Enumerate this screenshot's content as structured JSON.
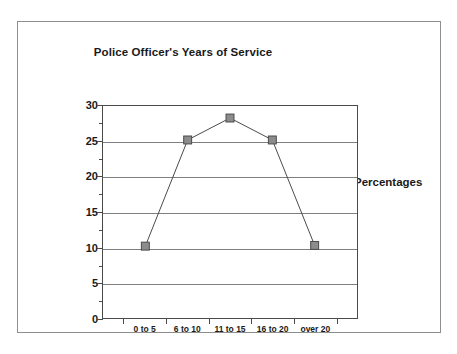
{
  "figure": {
    "title": "Police Officer's Years of Service",
    "y_axis_label": "Percentages"
  },
  "chart_data": {
    "type": "line",
    "title": "Police Officer's Years of Service",
    "xlabel": "",
    "ylabel": "Percentages",
    "categories": [
      "0 to 5",
      "6 to 10",
      "11 to 15",
      "16 to 20",
      "over 20"
    ],
    "values": [
      10.2,
      25.2,
      28.3,
      25.2,
      10.3
    ],
    "ylim": [
      0,
      30
    ],
    "y_ticks": [
      0,
      5,
      10,
      15,
      20,
      25,
      30
    ],
    "y_tick_labels": [
      "0",
      "5",
      "10",
      "15",
      "20",
      "25",
      "30"
    ],
    "y_minor_ticks": [
      2.5,
      7.5,
      12.5,
      17.5,
      22.5,
      27.5
    ],
    "grid": true,
    "grid_axis": "y",
    "legend": false,
    "marker": "square",
    "marker_color": "#8c8c8c",
    "line_color": "#4a4a4a",
    "gridline_color": "#7f7f7f",
    "background_color": "#ffffff",
    "border_color": "#8e8e8e"
  }
}
